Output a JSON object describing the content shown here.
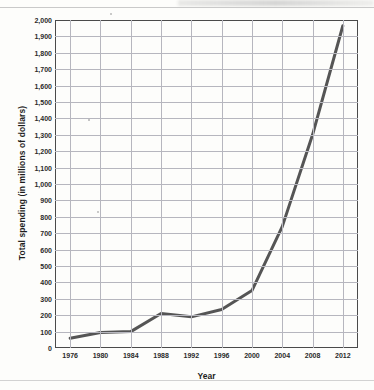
{
  "chart_data": {
    "type": "line",
    "title": "",
    "xlabel": "Year",
    "ylabel": "Total spending (in millions of dollars)",
    "x": [
      1976,
      1980,
      1984,
      1988,
      1992,
      1996,
      2000,
      2004,
      2008,
      2012
    ],
    "categories": [
      "1976",
      "1980",
      "1984",
      "1988",
      "1992",
      "1996",
      "2000",
      "2004",
      "2008",
      "2012"
    ],
    "values": [
      60,
      95,
      100,
      210,
      190,
      235,
      350,
      740,
      1300,
      1965
    ],
    "series": [
      {
        "name": "Total spending",
        "values": [
          60,
          95,
          100,
          210,
          190,
          235,
          350,
          740,
          1300,
          1965
        ]
      }
    ],
    "xlim": [
      1974,
      2014
    ],
    "ylim": [
      0,
      2000
    ],
    "ytick_step": 100,
    "ytick_labels": [
      "0",
      "100",
      "200",
      "300",
      "400",
      "500",
      "600",
      "700",
      "800",
      "900",
      "1,000",
      "1,100",
      "1,200",
      "1,300",
      "1,400",
      "1,500",
      "1,600",
      "1,700",
      "1,800",
      "1,900",
      "2,000"
    ],
    "xtick_labels": [
      "1976",
      "1980",
      "1984",
      "1988",
      "1992",
      "1996",
      "2000",
      "2004",
      "2008",
      "2012"
    ],
    "grid": true,
    "legend": false,
    "legend_position": "none",
    "line_color": "#555555",
    "grid_color": "#b6b6be",
    "frame_color": "#4a4a4a",
    "background_color": "#fdfdfb"
  }
}
